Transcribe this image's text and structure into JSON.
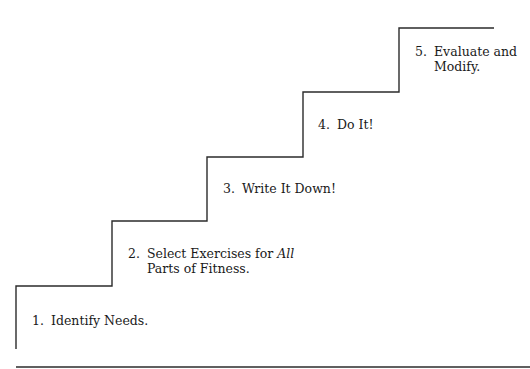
{
  "diagram": {
    "type": "staircase",
    "line_color": "#2b2b2b",
    "steps": [
      {
        "number": "1.",
        "line1": "Identify Needs.",
        "line2": ""
      },
      {
        "number": "2.",
        "line1_plain": "Select Exercises for ",
        "line1_italic": "All",
        "line2": "Parts of Fitness."
      },
      {
        "number": "3.",
        "line1": "Write It Down!",
        "line2": ""
      },
      {
        "number": "4.",
        "line1": "Do It!",
        "line2": ""
      },
      {
        "number": "5.",
        "line1": "Evaluate and",
        "line2": "Modify."
      }
    ]
  }
}
